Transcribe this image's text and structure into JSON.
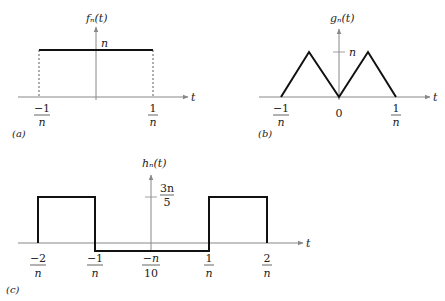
{
  "panels": {
    "a": {
      "tag": "(a)",
      "title": "fₙ(t)",
      "axis_label": "t",
      "height_label": "n",
      "ticks": [
        {
          "num": "−1",
          "den": "n"
        },
        {
          "num": "1",
          "den": "n"
        }
      ]
    },
    "b": {
      "tag": "(b)",
      "title": "gₙ(t)",
      "axis_label": "t",
      "height_label": "n",
      "ticks": [
        {
          "num": "−1",
          "den": "n"
        },
        {
          "num": "0",
          "den": ""
        },
        {
          "num": "1",
          "den": "n"
        }
      ]
    },
    "c": {
      "tag": "(c)",
      "title": "hₙ(t)",
      "axis_label": "t",
      "height_label": {
        "num": "3n",
        "den": "5"
      },
      "ticks": [
        {
          "num": "−2",
          "den": "n"
        },
        {
          "num": "−1",
          "den": "n"
        },
        {
          "num": "−n",
          "den": "10"
        },
        {
          "num": "1",
          "den": "n"
        },
        {
          "num": "2",
          "den": "n"
        }
      ]
    }
  },
  "colors": {
    "signal": "#111111",
    "axis": "#888888",
    "dashed": "#333333"
  }
}
